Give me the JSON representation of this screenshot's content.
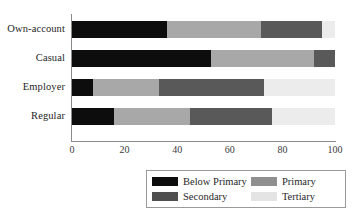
{
  "chart_data": {
    "type": "bar",
    "orientation": "horizontal",
    "stacked": true,
    "title": "",
    "xlabel": "",
    "ylabel": "",
    "xlim": [
      0,
      100
    ],
    "xticks": [
      "0",
      "20",
      "40",
      "60",
      "80",
      "100"
    ],
    "grid": false,
    "legend_position": "bottom",
    "categories": [
      "Own-account",
      "Casual",
      "Employer",
      "Regular"
    ],
    "series": [
      {
        "name": "Below Primary",
        "color": "#0d0d0d",
        "values": [
          36,
          53,
          8,
          16
        ]
      },
      {
        "name": "Primary",
        "color": "#a8a8a8",
        "values": [
          36,
          39,
          25,
          29
        ]
      },
      {
        "name": "Secondary",
        "color": "#595959",
        "values": [
          23,
          8,
          40,
          31
        ]
      },
      {
        "name": "Tertiary",
        "color": "#ececec",
        "values": [
          5,
          0,
          27,
          24
        ]
      }
    ]
  },
  "axis": {
    "ticks": [
      {
        "label": "0",
        "value": 0
      },
      {
        "label": "20",
        "value": 20
      },
      {
        "label": "40",
        "value": 40
      },
      {
        "label": "60",
        "value": 60
      },
      {
        "label": "80",
        "value": 80
      },
      {
        "label": "100",
        "value": 100
      }
    ]
  },
  "legend": {
    "items": [
      {
        "label": "Below Primary",
        "key": "below-primary"
      },
      {
        "label": "Primary",
        "key": "primary"
      },
      {
        "label": "Secondary",
        "key": "secondary"
      },
      {
        "label": "Tertiary",
        "key": "tertiary"
      }
    ]
  }
}
